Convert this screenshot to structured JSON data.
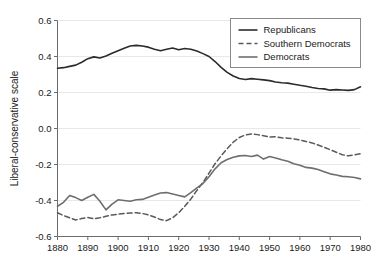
{
  "chart_data": {
    "type": "line",
    "title": "",
    "subtitle": "",
    "xlabel": "",
    "ylabel": "Liberal-conservative scale",
    "xlim": [
      1880,
      1980
    ],
    "ylim": [
      -0.6,
      0.6
    ],
    "xticks": [
      1880,
      1890,
      1900,
      1910,
      1920,
      1930,
      1940,
      1950,
      1960,
      1970,
      1980
    ],
    "yticks": [
      -0.6,
      -0.4,
      -0.2,
      0.0,
      0.2,
      0.4,
      0.6
    ],
    "xtick_labels": [
      "1880",
      "1890",
      "1900",
      "1910",
      "1920",
      "1930",
      "1940",
      "1950",
      "1960",
      "1970",
      "1980"
    ],
    "ytick_labels": [
      "-0.6",
      "-0.4",
      "-0.2",
      "0.0",
      "0.2",
      "0.4",
      "0.6"
    ],
    "grid": true,
    "grid_axis": "y",
    "legend_position": "top-right",
    "x": [
      1880,
      1882,
      1884,
      1886,
      1888,
      1890,
      1892,
      1894,
      1896,
      1898,
      1900,
      1902,
      1904,
      1906,
      1908,
      1910,
      1912,
      1914,
      1916,
      1918,
      1920,
      1922,
      1924,
      1926,
      1928,
      1930,
      1932,
      1934,
      1936,
      1938,
      1940,
      1942,
      1944,
      1946,
      1948,
      1950,
      1952,
      1954,
      1956,
      1958,
      1960,
      1962,
      1964,
      1966,
      1968,
      1970,
      1972,
      1974,
      1976,
      1978,
      1980
    ],
    "series": [
      {
        "name": "Republicans",
        "color": "#2b2b2b",
        "style": "solid",
        "values": [
          0.335,
          0.338,
          0.345,
          0.352,
          0.368,
          0.388,
          0.398,
          0.392,
          0.403,
          0.418,
          0.432,
          0.446,
          0.458,
          0.462,
          0.458,
          0.452,
          0.44,
          0.432,
          0.44,
          0.447,
          0.437,
          0.444,
          0.44,
          0.43,
          0.416,
          0.4,
          0.372,
          0.34,
          0.312,
          0.292,
          0.278,
          0.272,
          0.277,
          0.274,
          0.27,
          0.266,
          0.258,
          0.254,
          0.252,
          0.246,
          0.24,
          0.235,
          0.228,
          0.222,
          0.22,
          0.213,
          0.216,
          0.214,
          0.212,
          0.216,
          0.232
        ]
      },
      {
        "name": "Southern Democrats",
        "color": "#5a5a5a",
        "style": "dashed",
        "values": [
          -0.468,
          -0.484,
          -0.496,
          -0.508,
          -0.5,
          -0.494,
          -0.502,
          -0.496,
          -0.488,
          -0.48,
          -0.476,
          -0.472,
          -0.47,
          -0.468,
          -0.472,
          -0.48,
          -0.492,
          -0.506,
          -0.512,
          -0.496,
          -0.468,
          -0.432,
          -0.392,
          -0.344,
          -0.3,
          -0.248,
          -0.196,
          -0.152,
          -0.112,
          -0.076,
          -0.05,
          -0.036,
          -0.03,
          -0.034,
          -0.04,
          -0.048,
          -0.046,
          -0.052,
          -0.054,
          -0.058,
          -0.064,
          -0.072,
          -0.08,
          -0.092,
          -0.104,
          -0.118,
          -0.132,
          -0.146,
          -0.152,
          -0.146,
          -0.14
        ]
      },
      {
        "name": "Democrats",
        "color": "#6e6e6e",
        "style": "solid",
        "values": [
          -0.432,
          -0.41,
          -0.372,
          -0.384,
          -0.4,
          -0.382,
          -0.366,
          -0.404,
          -0.452,
          -0.42,
          -0.396,
          -0.4,
          -0.404,
          -0.396,
          -0.394,
          -0.382,
          -0.37,
          -0.358,
          -0.356,
          -0.364,
          -0.372,
          -0.38,
          -0.356,
          -0.33,
          -0.306,
          -0.268,
          -0.224,
          -0.19,
          -0.172,
          -0.16,
          -0.152,
          -0.15,
          -0.156,
          -0.148,
          -0.17,
          -0.156,
          -0.164,
          -0.174,
          -0.182,
          -0.196,
          -0.204,
          -0.216,
          -0.22,
          -0.228,
          -0.24,
          -0.252,
          -0.258,
          -0.266,
          -0.268,
          -0.272,
          -0.28
        ]
      }
    ]
  },
  "legend": {
    "entries": [
      {
        "label": "Republicans"
      },
      {
        "label": "Southern Democrats"
      },
      {
        "label": "Democrats"
      }
    ]
  },
  "axes": {
    "y_title": "Liberal-conservative scale"
  }
}
